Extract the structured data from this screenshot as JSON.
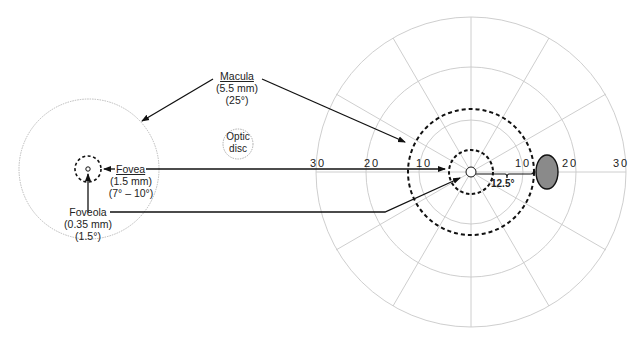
{
  "diagram": {
    "macula": {
      "name": "Macula",
      "size": "(5.5 mm)",
      "angle": "(25°)"
    },
    "optic_disc": {
      "line1": "Optic",
      "line2": "disc"
    },
    "fovea": {
      "name": "Fovea",
      "size": "(1.5 mm)",
      "angle": "(7° – 10°)"
    },
    "foveola": {
      "name": "Foveola",
      "size": "(0.35 mm)",
      "angle": "(1.5°)"
    },
    "visual_field": {
      "ticks_left": [
        "30",
        "20",
        "10"
      ],
      "ticks_right": [
        "10",
        "20",
        "30"
      ],
      "brace_label": "12.5°"
    },
    "colors": {
      "grid": "#c8c8c8",
      "ink": "#111111",
      "blind_spot": "#8a8a8a"
    }
  }
}
